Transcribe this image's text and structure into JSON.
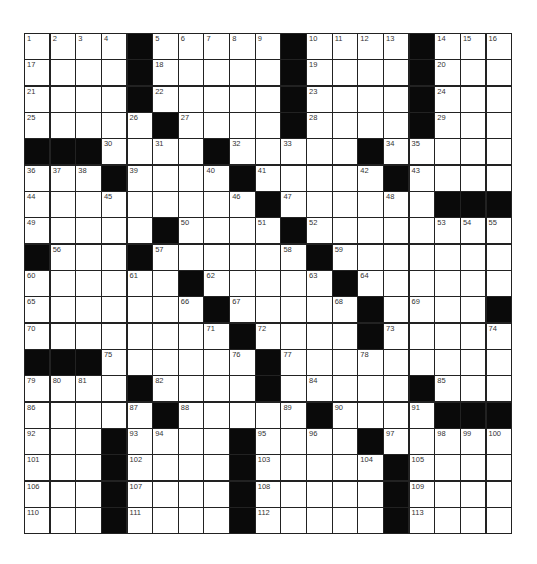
{
  "puzzle": {
    "rows": 19,
    "cols": 19,
    "grid": [
      "....#.....#....#...",
      "....#.....#....#...",
      "....#.....#....#...",
      ".....#....#....#...",
      "###....#.....#.....",
      "...#....#.....#....",
      ".........#......###",
      ".....#....#........",
      "#...#......#.......",
      "......#.....#......",
      ".......#.....#....#",
      "........#....#.....",
      "###......#.........",
      "....#....#.....#...",
      ".....#.....#....###",
      "...#....#....#.....",
      "...#....#.....#....",
      "...#....#.....#....",
      "...#....#.....#...."
    ],
    "numbers": [
      [
        0,
        0,
        1
      ],
      [
        0,
        1,
        2
      ],
      [
        0,
        2,
        3
      ],
      [
        0,
        3,
        4
      ],
      [
        0,
        5,
        5
      ],
      [
        0,
        6,
        6
      ],
      [
        0,
        7,
        7
      ],
      [
        0,
        8,
        8
      ],
      [
        0,
        9,
        9
      ],
      [
        0,
        11,
        10
      ],
      [
        0,
        12,
        11
      ],
      [
        0,
        13,
        12
      ],
      [
        0,
        14,
        13
      ],
      [
        0,
        16,
        14
      ],
      [
        0,
        17,
        15
      ],
      [
        0,
        18,
        16
      ],
      [
        1,
        0,
        17
      ],
      [
        1,
        5,
        18
      ],
      [
        1,
        11,
        19
      ],
      [
        1,
        16,
        20
      ],
      [
        2,
        0,
        21
      ],
      [
        2,
        5,
        22
      ],
      [
        2,
        11,
        23
      ],
      [
        2,
        16,
        24
      ],
      [
        3,
        0,
        25
      ],
      [
        3,
        4,
        26
      ],
      [
        3,
        6,
        27
      ],
      [
        3,
        11,
        28
      ],
      [
        3,
        16,
        29
      ],
      [
        4,
        3,
        30
      ],
      [
        4,
        5,
        31
      ],
      [
        4,
        8,
        32
      ],
      [
        4,
        10,
        33
      ],
      [
        4,
        14,
        34
      ],
      [
        4,
        15,
        35
      ],
      [
        5,
        0,
        36
      ],
      [
        5,
        1,
        37
      ],
      [
        5,
        2,
        38
      ],
      [
        5,
        4,
        39
      ],
      [
        5,
        7,
        40
      ],
      [
        5,
        9,
        41
      ],
      [
        5,
        13,
        42
      ],
      [
        5,
        15,
        43
      ],
      [
        6,
        0,
        44
      ],
      [
        6,
        3,
        45
      ],
      [
        6,
        8,
        46
      ],
      [
        6,
        10,
        47
      ],
      [
        6,
        14,
        48
      ],
      [
        7,
        0,
        49
      ],
      [
        7,
        6,
        50
      ],
      [
        7,
        9,
        51
      ],
      [
        7,
        11,
        52
      ],
      [
        7,
        16,
        53
      ],
      [
        7,
        17,
        54
      ],
      [
        7,
        18,
        55
      ],
      [
        8,
        1,
        56
      ],
      [
        8,
        5,
        57
      ],
      [
        8,
        10,
        58
      ],
      [
        8,
        12,
        59
      ],
      [
        9,
        0,
        60
      ],
      [
        9,
        4,
        61
      ],
      [
        9,
        7,
        62
      ],
      [
        9,
        11,
        63
      ],
      [
        9,
        13,
        64
      ],
      [
        10,
        0,
        65
      ],
      [
        10,
        6,
        66
      ],
      [
        10,
        8,
        67
      ],
      [
        10,
        12,
        68
      ],
      [
        10,
        15,
        69
      ],
      [
        11,
        0,
        70
      ],
      [
        11,
        7,
        71
      ],
      [
        11,
        9,
        72
      ],
      [
        11,
        14,
        73
      ],
      [
        11,
        18,
        74
      ],
      [
        12,
        3,
        75
      ],
      [
        12,
        8,
        76
      ],
      [
        12,
        10,
        77
      ],
      [
        12,
        13,
        78
      ],
      [
        13,
        0,
        79
      ],
      [
        13,
        1,
        80
      ],
      [
        13,
        2,
        81
      ],
      [
        13,
        5,
        82
      ],
      [
        13,
        9,
        83
      ],
      [
        13,
        11,
        84
      ],
      [
        13,
        16,
        85
      ],
      [
        14,
        0,
        86
      ],
      [
        14,
        4,
        87
      ],
      [
        14,
        6,
        88
      ],
      [
        14,
        10,
        89
      ],
      [
        14,
        12,
        90
      ],
      [
        14,
        15,
        91
      ],
      [
        15,
        0,
        92
      ],
      [
        15,
        4,
        93
      ],
      [
        15,
        5,
        94
      ],
      [
        15,
        9,
        95
      ],
      [
        15,
        11,
        96
      ],
      [
        15,
        14,
        97
      ],
      [
        15,
        16,
        98
      ],
      [
        15,
        17,
        99
      ],
      [
        15,
        18,
        100
      ],
      [
        16,
        0,
        101
      ],
      [
        16,
        4,
        102
      ],
      [
        16,
        9,
        103
      ],
      [
        16,
        13,
        104
      ],
      [
        16,
        15,
        105
      ],
      [
        17,
        0,
        106
      ],
      [
        17,
        4,
        107
      ],
      [
        17,
        9,
        108
      ],
      [
        17,
        15,
        109
      ],
      [
        18,
        0,
        110
      ],
      [
        18,
        4,
        111
      ],
      [
        18,
        9,
        112
      ],
      [
        18,
        15,
        113
      ]
    ]
  },
  "colors": {
    "block": "#0a0a0a",
    "line": "#222222",
    "number": "#333333",
    "cell": "#ffffff"
  }
}
